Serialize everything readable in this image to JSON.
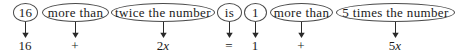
{
  "diagram": {
    "width": 456,
    "height": 54,
    "ink_color": "#1a1a1a",
    "oval_stroke_color": "#4a4a4a",
    "arrow_color": "#2a2a2a",
    "phrases": [
      {
        "id": "p1",
        "text": "16",
        "x": 13,
        "y": 3,
        "w": 25,
        "h": 19,
        "font_size": 13
      },
      {
        "id": "p2",
        "text": "more than",
        "x": 42,
        "y": 3,
        "w": 67,
        "h": 19,
        "font_size": 13
      },
      {
        "id": "p3",
        "text": "twice the number",
        "x": 111,
        "y": 3,
        "w": 104,
        "h": 19,
        "font_size": 13
      },
      {
        "id": "p4",
        "text": "is",
        "x": 217,
        "y": 3,
        "w": 25,
        "h": 19,
        "font_size": 13
      },
      {
        "id": "p5",
        "text": "1",
        "x": 244,
        "y": 3,
        "w": 23,
        "h": 19,
        "font_size": 13
      },
      {
        "id": "p6",
        "text": "more than",
        "x": 270,
        "y": 3,
        "w": 63,
        "h": 19,
        "font_size": 13
      },
      {
        "id": "p7",
        "text": "5 times the number",
        "x": 336,
        "y": 3,
        "w": 119,
        "h": 19,
        "font_size": 13
      }
    ],
    "arrows": [
      {
        "id": "a1",
        "x": 25,
        "top": 22,
        "bottom": 38
      },
      {
        "id": "a2",
        "x": 75,
        "top": 22,
        "bottom": 38
      },
      {
        "id": "a3",
        "x": 163,
        "top": 22,
        "bottom": 38
      },
      {
        "id": "a4",
        "x": 229,
        "top": 22,
        "bottom": 38
      },
      {
        "id": "a5",
        "x": 255,
        "top": 22,
        "bottom": 38
      },
      {
        "id": "a6",
        "x": 301,
        "top": 22,
        "bottom": 38
      },
      {
        "id": "a7",
        "x": 395,
        "top": 22,
        "bottom": 38
      }
    ],
    "terms": [
      {
        "id": "t1",
        "text": "16",
        "html": "16",
        "center_x": 25,
        "y": 39
      },
      {
        "id": "t2",
        "text": "+",
        "html": "+",
        "center_x": 75,
        "y": 39
      },
      {
        "id": "t3",
        "text": "2x",
        "html": "2<i>x</i>",
        "center_x": 163,
        "y": 39
      },
      {
        "id": "t4",
        "text": "=",
        "html": "=",
        "center_x": 229,
        "y": 39
      },
      {
        "id": "t5",
        "text": "1",
        "html": "1",
        "center_x": 255,
        "y": 39
      },
      {
        "id": "t6",
        "text": "+",
        "html": "+",
        "center_x": 301,
        "y": 39
      },
      {
        "id": "t7",
        "text": "5x",
        "html": "5<i>x</i>",
        "center_x": 395,
        "y": 39
      }
    ],
    "equation_plain": "16 + 2x = 1 + 5x",
    "sentence_plain": "16 more than twice the number is 1 more than 5 times the number"
  }
}
